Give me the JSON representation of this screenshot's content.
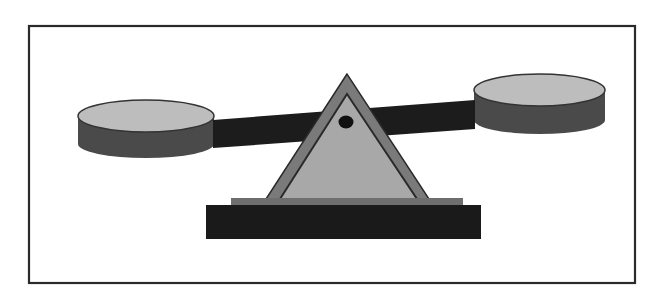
{
  "figure": {
    "frame": {
      "x": 28,
      "y": 25,
      "width": 607,
      "height": 258,
      "stroke": "#2a2a2a"
    },
    "colors": {
      "background": "#ffffff",
      "frame": "#2a2a2a",
      "beam": "#1c1c1c",
      "pan_side": "#4a4a4a",
      "pan_top": "#bdbdbd",
      "fulcrum_outer": "#7a7a7a",
      "fulcrum_inner": "#a8a8a8",
      "fulcrum_outline": "#2a2a2a",
      "pivot": "#111111",
      "base_plate": "#6e6e6e",
      "base_block": "#1a1a1a"
    },
    "parts": [
      {
        "name": "left-pan",
        "tilt": "lower"
      },
      {
        "name": "right-pan",
        "tilt": "higher"
      },
      {
        "name": "beam"
      },
      {
        "name": "fulcrum-triangle"
      },
      {
        "name": "pivot-dot"
      },
      {
        "name": "base"
      }
    ]
  }
}
